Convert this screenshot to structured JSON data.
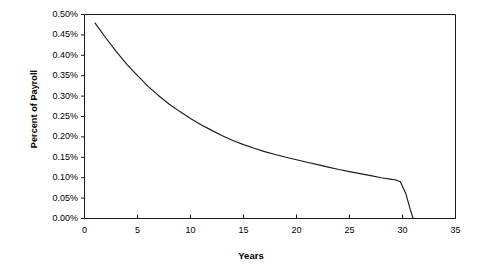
{
  "chart_data": {
    "type": "line",
    "title": "",
    "xlabel": "Years",
    "ylabel": "Percent of Payroll",
    "xlim": [
      0,
      35
    ],
    "ylim": [
      0,
      0.005
    ],
    "grid": false,
    "legend": "none",
    "x_ticks": [
      "0",
      "5",
      "10",
      "15",
      "20",
      "25",
      "30",
      "35"
    ],
    "x_tick_values": [
      0,
      5,
      10,
      15,
      20,
      25,
      30,
      35
    ],
    "y_ticks": [
      "0.00%",
      "0.05%",
      "0.10%",
      "0.15%",
      "0.20%",
      "0.25%",
      "0.30%",
      "0.35%",
      "0.40%",
      "0.45%",
      "0.50%"
    ],
    "y_tick_values": [
      0.0,
      0.0005,
      0.001,
      0.0015,
      0.002,
      0.0025,
      0.003,
      0.0035,
      0.004,
      0.0045,
      0.005
    ],
    "series": [
      {
        "name": "Percent of Payroll",
        "color": "#1a1a1a",
        "x": [
          1,
          2,
          3,
          4,
          5,
          6,
          7,
          8,
          9,
          10,
          11,
          12,
          13,
          14,
          15,
          16,
          17,
          18,
          19,
          20,
          21,
          22,
          23,
          24,
          25,
          26,
          27,
          28,
          29,
          29.3,
          29.8,
          30.3,
          30.7,
          31
        ],
        "values": [
          0.479,
          0.443,
          0.409,
          0.378,
          0.35,
          0.324,
          0.301,
          0.28,
          0.262,
          0.245,
          0.23,
          0.216,
          0.203,
          0.191,
          0.181,
          0.172,
          0.164,
          0.157,
          0.15,
          0.144,
          0.138,
          0.132,
          0.126,
          0.12,
          0.115,
          0.11,
          0.105,
          0.1,
          0.096,
          0.095,
          0.09,
          0.062,
          0.025,
          0.0
        ],
        "units": "percent"
      }
    ]
  },
  "axes": {
    "y_title": "Percent of Payroll",
    "x_title": "Years"
  },
  "style": {
    "axis_color": "#1a1a1a",
    "line_color": "#1a1a1a",
    "background": "#ffffff"
  }
}
